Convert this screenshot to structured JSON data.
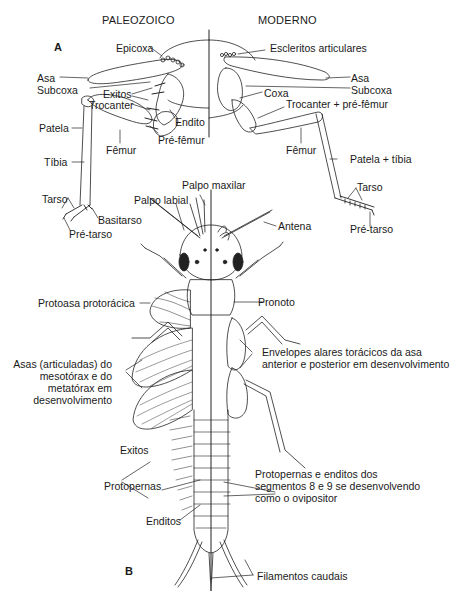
{
  "headers": {
    "left": "PALEOZOICO",
    "right": "MODERNO"
  },
  "panels": {
    "a": "A",
    "b": "B"
  },
  "paleozoic_leg_labels": {
    "epicoxa": "Epicoxa",
    "asa": "Asa",
    "subcoxa": "Subcoxa",
    "exitos": "Exitos",
    "trocanter": "Trocanter",
    "endito": "Endito",
    "patela": "Patela",
    "prefemur": "Pré-fêmur",
    "femur": "Fêmur",
    "tibia": "Tíbia",
    "tarso": "Tarso",
    "basitarso": "Basitarso",
    "pretarso": "Pré-tarso"
  },
  "modern_leg_labels": {
    "escleritos": "Escleritos articulares",
    "asa": "Asa",
    "subcoxa": "Subcoxa",
    "coxa": "Coxa",
    "trocanter_prefemur": "Trocanter + pré-fêmur",
    "femur": "Fêmur",
    "patela_tibia": "Patela + tíbia",
    "tarso": "Tarso",
    "pretarso": "Pré-tarso"
  },
  "body_labels": {
    "palpo_maxilar": "Palpo maxilar",
    "palpo_labial": "Palpo labial",
    "antena": "Antena",
    "protoasa": "Protoasa protorácica",
    "pronoto": "Pronoto",
    "asas_articuladas": "Asas (articuladas) do mesotórax e do metatórax em desenvolvimento",
    "asas_articuladas_lines": [
      "Asas (articuladas) do",
      "mesotórax e do",
      "metatórax em",
      "desenvolvimento"
    ],
    "envelopes_lines": [
      "Envelopes alares torácicos da asa",
      "anterior e posterior em desenvolvimento"
    ],
    "exitos": "Exitos",
    "protopernas": "Protopernas",
    "protopernas_enditos_lines": [
      "Protopernas e enditos dos",
      "segmentos 8 e 9 se desenvolvendo",
      "como o ovipositor"
    ],
    "enditos": "Enditos",
    "filamentos": "Filamentos caudais"
  },
  "colors": {
    "ink": "#1a1a1a",
    "background": "#ffffff"
  }
}
